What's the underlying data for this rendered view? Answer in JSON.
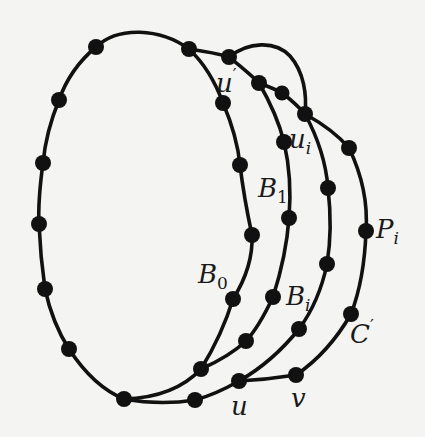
{
  "figure": {
    "colors": {
      "background": "#f4f4f2",
      "ink": "#111111"
    },
    "labels": {
      "u_prime": {
        "base": "u",
        "sup": "′"
      },
      "u_i": {
        "base": "u",
        "sub": "i"
      },
      "B_1": {
        "base": "B",
        "sub": "1"
      },
      "B_0": {
        "base": "B",
        "sub": "0"
      },
      "B_i": {
        "base": "B",
        "sub": "i"
      },
      "P_i": {
        "base": "P",
        "sub": "i"
      },
      "C_prime": {
        "base": "C",
        "sup": "′"
      },
      "u": {
        "base": "u"
      },
      "v": {
        "base": "v"
      }
    },
    "node_count": 34,
    "edges": [
      "outer cycle B0 (left ellipse)",
      "path B1",
      "path Bi",
      "path Pi",
      "arc C' through v",
      "top arc from u' region to Pi"
    ]
  }
}
